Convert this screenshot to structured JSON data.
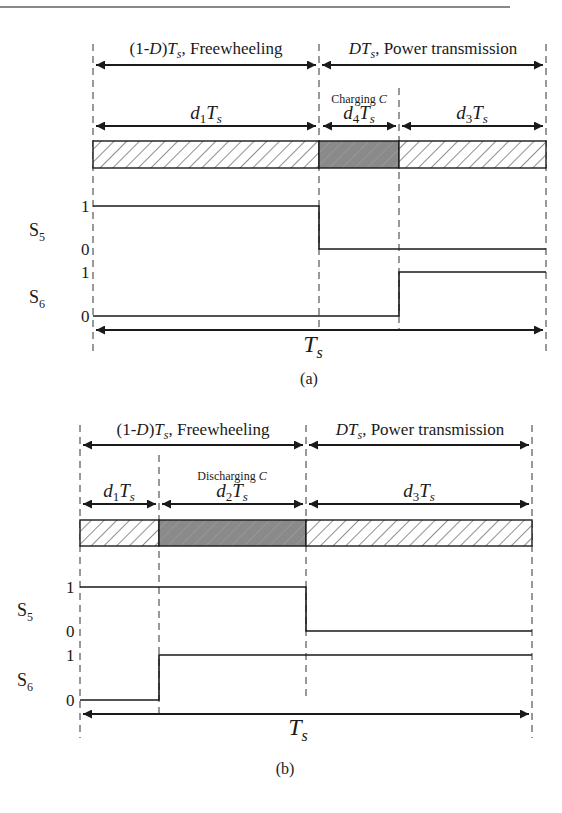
{
  "figure": {
    "top_rule_color": "#888888",
    "hatch_fill": "#ffffff",
    "shaded_fill": "#8a8a8a",
    "line_color": "#1a1a1a"
  },
  "panel_a": {
    "caption": "(a)",
    "top_left": {
      "prefix": "(1-",
      "D": "D",
      "mid": ")",
      "T": "T",
      "sub": "s",
      "suffix": ", Freewheeling"
    },
    "top_right": {
      "D": "D",
      "T": "T",
      "sub": "s",
      "suffix": ", Power transmission"
    },
    "note": {
      "text": "Charging ",
      "var": "C"
    },
    "segments": [
      {
        "d": "d",
        "idx": "1",
        "T": "T",
        "sub": "s",
        "fill": "hatch"
      },
      {
        "d": "d",
        "idx": "4",
        "T": "T",
        "sub": "s",
        "fill": "shaded"
      },
      {
        "d": "d",
        "idx": "3",
        "T": "T",
        "sub": "s",
        "fill": "hatch"
      }
    ],
    "signals": [
      {
        "name": "S",
        "sub": "5",
        "high": "1",
        "low": "0"
      },
      {
        "name": "S",
        "sub": "6",
        "high": "1",
        "low": "0"
      }
    ],
    "period": {
      "T": "T",
      "sub": "s"
    }
  },
  "panel_b": {
    "caption": "(b)",
    "top_left": {
      "prefix": "(1-",
      "D": "D",
      "mid": ")",
      "T": "T",
      "sub": "s",
      "suffix": ", Freewheeling"
    },
    "top_right": {
      "D": "D",
      "T": "T",
      "sub": "s",
      "suffix": ", Power transmission"
    },
    "note": {
      "text": "Discharging ",
      "var": "C"
    },
    "segments": [
      {
        "d": "d",
        "idx": "1",
        "T": "T",
        "sub": "s",
        "fill": "hatch"
      },
      {
        "d": "d",
        "idx": "2",
        "T": "T",
        "sub": "s",
        "fill": "shaded"
      },
      {
        "d": "d",
        "idx": "3",
        "T": "T",
        "sub": "s",
        "fill": "hatch"
      }
    ],
    "signals": [
      {
        "name": "S",
        "sub": "5",
        "high": "1",
        "low": "0"
      },
      {
        "name": "S",
        "sub": "6",
        "high": "1",
        "low": "0"
      }
    ],
    "period": {
      "T": "T",
      "sub": "s"
    }
  }
}
